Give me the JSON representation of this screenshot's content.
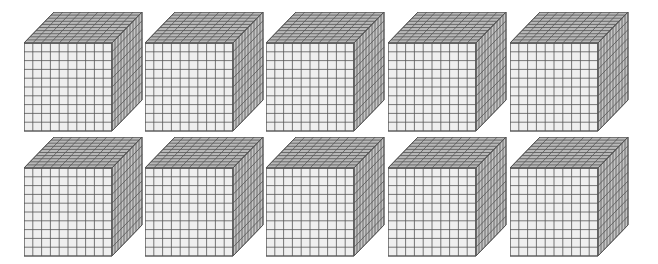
{
  "figure": {
    "rows": 2,
    "columns": 5,
    "cube_grid": 10,
    "colors": {
      "front_face": "#efefef",
      "top_face": "#b8b8b8",
      "side_face": "#c4c4c4",
      "grid_line": "#555555"
    }
  },
  "cubes": [
    {
      "row": 0,
      "col": 0,
      "x": 24,
      "y": 12
    },
    {
      "row": 0,
      "col": 1,
      "x": 145,
      "y": 12
    },
    {
      "row": 0,
      "col": 2,
      "x": 266,
      "y": 12
    },
    {
      "row": 0,
      "col": 3,
      "x": 388,
      "y": 12
    },
    {
      "row": 0,
      "col": 4,
      "x": 510,
      "y": 12
    },
    {
      "row": 1,
      "col": 0,
      "x": 24,
      "y": 137
    },
    {
      "row": 1,
      "col": 1,
      "x": 145,
      "y": 137
    },
    {
      "row": 1,
      "col": 2,
      "x": 266,
      "y": 137
    },
    {
      "row": 1,
      "col": 3,
      "x": 388,
      "y": 137
    },
    {
      "row": 1,
      "col": 4,
      "x": 510,
      "y": 137
    }
  ]
}
